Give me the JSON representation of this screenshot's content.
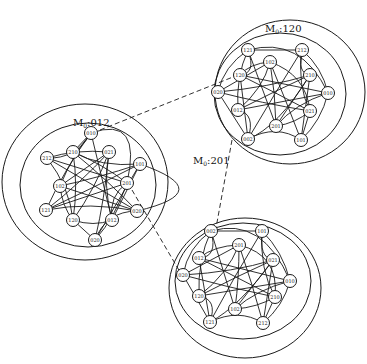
{
  "clusters": [
    {
      "id": "left",
      "title_main": "M",
      "title_sub": "0",
      "title_value": ":012",
      "title_pos": [
        73,
        126
      ],
      "ring_outer": {
        "cx": 85,
        "cy": 182,
        "rx": 83,
        "ry": 78
      },
      "ring_inner": {
        "cx": 88,
        "cy": 185,
        "rx": 68,
        "ry": 62
      },
      "nodes": [
        {
          "label": "010",
          "x": 91,
          "y": 133
        },
        {
          "label": "210",
          "x": 73,
          "y": 152
        },
        {
          "label": "021",
          "x": 109,
          "y": 152
        },
        {
          "label": "212",
          "x": 47,
          "y": 158
        },
        {
          "label": "101",
          "x": 140,
          "y": 164
        },
        {
          "label": "102",
          "x": 60,
          "y": 186
        },
        {
          "label": "201",
          "x": 127,
          "y": 183
        },
        {
          "label": "121",
          "x": 46,
          "y": 210
        },
        {
          "label": "120",
          "x": 73,
          "y": 220
        },
        {
          "label": "012",
          "x": 112,
          "y": 220
        },
        {
          "label": "020",
          "x": 137,
          "y": 211
        },
        {
          "label": "020",
          "x": 95,
          "y": 240
        }
      ]
    },
    {
      "id": "top-right",
      "title_main": "M",
      "title_sub": "0",
      "title_value": ":120",
      "title_pos": [
        265,
        32
      ],
      "ring_outer": {
        "cx": 290,
        "cy": 92,
        "rx": 75,
        "ry": 72
      },
      "ring_inner": {
        "cx": 280,
        "cy": 94,
        "rx": 66,
        "ry": 61
      },
      "nodes": [
        {
          "label": "121",
          "x": 248,
          "y": 50
        },
        {
          "label": "212",
          "x": 302,
          "y": 50
        },
        {
          "label": "102",
          "x": 270,
          "y": 62
        },
        {
          "label": "120",
          "x": 240,
          "y": 75
        },
        {
          "label": "210",
          "x": 310,
          "y": 75
        },
        {
          "label": "020",
          "x": 218,
          "y": 92
        },
        {
          "label": "010",
          "x": 328,
          "y": 93
        },
        {
          "label": "012",
          "x": 238,
          "y": 110
        },
        {
          "label": "021",
          "x": 310,
          "y": 111
        },
        {
          "label": "201",
          "x": 276,
          "y": 126
        },
        {
          "label": "002",
          "x": 248,
          "y": 139
        },
        {
          "label": "101",
          "x": 301,
          "y": 140
        }
      ]
    },
    {
      "id": "bottom",
      "title_main": "M",
      "title_sub": "0",
      "title_value": ":201",
      "title_pos": [
        193,
        164
      ],
      "ring_outer": {
        "cx": 245,
        "cy": 288,
        "rx": 76,
        "ry": 70
      },
      "ring_inner": {
        "cx": 243,
        "cy": 281,
        "rx": 68,
        "ry": 58
      },
      "nodes": [
        {
          "label": "002",
          "x": 211,
          "y": 231
        },
        {
          "label": "101",
          "x": 262,
          "y": 231
        },
        {
          "label": "201",
          "x": 239,
          "y": 245
        },
        {
          "label": "012",
          "x": 199,
          "y": 258
        },
        {
          "label": "021",
          "x": 273,
          "y": 260
        },
        {
          "label": "020",
          "x": 183,
          "y": 275
        },
        {
          "label": "010",
          "x": 290,
          "y": 281
        },
        {
          "label": "120",
          "x": 199,
          "y": 296
        },
        {
          "label": "210",
          "x": 275,
          "y": 297
        },
        {
          "label": "102",
          "x": 235,
          "y": 309
        },
        {
          "label": "121",
          "x": 210,
          "y": 322
        },
        {
          "label": "212",
          "x": 263,
          "y": 323
        }
      ]
    }
  ],
  "connections": [
    {
      "from": "left-010",
      "to": "top-right-120",
      "style": "dashed",
      "path": [
        [
          100,
          130
        ],
        [
          238,
          75
        ]
      ]
    },
    {
      "from": "left-201",
      "to": "bottom-020",
      "style": "dashed",
      "path": [
        [
          132,
          190
        ],
        [
          180,
          272
        ]
      ]
    },
    {
      "from": "top-right-002",
      "to": "bottom-002",
      "style": "dashed",
      "path": [
        [
          232,
          140
        ],
        [
          216,
          228
        ]
      ]
    }
  ]
}
